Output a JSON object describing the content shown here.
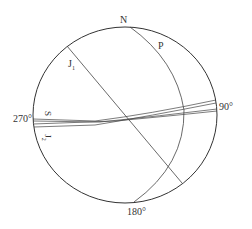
{
  "diagram": {
    "type": "stereographic-projection",
    "labels": {
      "north": "N",
      "east": "90°",
      "south": "180°",
      "west": "270°",
      "plane_p": "P",
      "joint_1": "J",
      "joint_1_sub": "1",
      "joint_2": "J",
      "joint_2_sub": "2",
      "slope_s": "S"
    },
    "colors": {
      "stroke": "#333333",
      "background": "#ffffff"
    }
  }
}
